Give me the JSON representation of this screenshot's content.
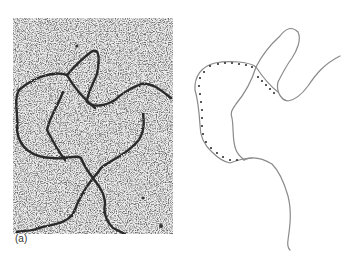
{
  "figure": {
    "panel_label": "(a)",
    "micrograph": {
      "description": "electron micrograph of DNA strands on speckled background",
      "background_color": "#d8d8d8",
      "strand_color": "#2a2a2a"
    },
    "drawing": {
      "description": "line tracing of DNA molecule with dotted loop region",
      "line_color": "#8a8a8a",
      "dot_color": "#222222"
    }
  }
}
